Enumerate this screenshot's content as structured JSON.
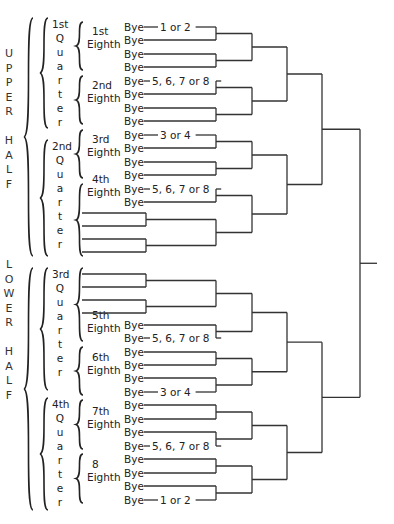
{
  "colors": {
    "ink": "#333333",
    "background": "#ffffff"
  },
  "halves": [
    {
      "label": "UPPER HALF",
      "letters": [
        "U",
        "P",
        "P",
        "E",
        "R",
        "",
        "H",
        "A",
        "L",
        "F"
      ]
    },
    {
      "label": "LOWER HALF",
      "letters": [
        "L",
        "O",
        "W",
        "E",
        "R",
        "",
        "H",
        "A",
        "L",
        "F"
      ]
    }
  ],
  "quarters": [
    {
      "label_lines": [
        "1st",
        "Q",
        "u",
        "a",
        "r",
        "t",
        "e",
        "r"
      ]
    },
    {
      "label_lines": [
        "2nd",
        "Q",
        "u",
        "a",
        "r",
        "t",
        "e",
        "r"
      ]
    },
    {
      "label_lines": [
        "3rd",
        "Q",
        "u",
        "a",
        "r",
        "t",
        "e",
        "r"
      ]
    },
    {
      "label_lines": [
        "4th",
        "Q",
        "u",
        "a",
        "r",
        "t",
        "e",
        "r"
      ]
    }
  ],
  "eighths": [
    {
      "label_lines": [
        "1st",
        "Eighth"
      ]
    },
    {
      "label_lines": [
        "2nd",
        "Eighth"
      ]
    },
    {
      "label_lines": [
        "3rd",
        "Eighth"
      ]
    },
    {
      "label_lines": [
        "4th",
        "Eighth"
      ]
    },
    {
      "label_lines": [
        "5th",
        "Eighth"
      ]
    },
    {
      "label_lines": [
        "6th",
        "Eighth"
      ]
    },
    {
      "label_lines": [
        "7th",
        "Eighth"
      ]
    },
    {
      "label_lines": [
        "8",
        "Eighth"
      ]
    }
  ],
  "bye_label": "Bye",
  "upper_rows": [
    {
      "y": 27,
      "bye": true,
      "seed": "1 or 2"
    },
    {
      "y": 40,
      "bye": true
    },
    {
      "y": 54,
      "bye": true
    },
    {
      "y": 67,
      "bye": true
    },
    {
      "y": 81,
      "bye": true,
      "seed": "5, 6, 7 or 8"
    },
    {
      "y": 94,
      "bye": true
    },
    {
      "y": 108,
      "bye": true
    },
    {
      "y": 121,
      "bye": true
    },
    {
      "y": 135,
      "bye": true,
      "seed": "3 or 4"
    },
    {
      "y": 148,
      "bye": true
    },
    {
      "y": 162,
      "bye": true
    },
    {
      "y": 175,
      "bye": true
    },
    {
      "y": 189,
      "bye": true,
      "seed": "5, 6, 7 or 8"
    },
    {
      "y": 202,
      "bye": true
    }
  ],
  "upper_open_lines": [
    213,
    226,
    239,
    252
  ],
  "lower_open_lines": [
    274,
    287,
    300,
    313
  ],
  "lower_rows": [
    {
      "y": 325,
      "bye": true
    },
    {
      "y": 338,
      "bye": true,
      "seed": "5, 6, 7 or 8"
    },
    {
      "y": 352,
      "bye": true
    },
    {
      "y": 365,
      "bye": true
    },
    {
      "y": 378,
      "bye": true
    },
    {
      "y": 392,
      "bye": true,
      "seed": "3 or 4"
    },
    {
      "y": 405,
      "bye": true
    },
    {
      "y": 419,
      "bye": true
    },
    {
      "y": 432,
      "bye": true
    },
    {
      "y": 446,
      "bye": true,
      "seed": "5, 6, 7 or 8"
    },
    {
      "y": 459,
      "bye": true
    },
    {
      "y": 473,
      "bye": true
    },
    {
      "y": 486,
      "bye": true
    },
    {
      "y": 500,
      "bye": true,
      "seed": "1 or 2"
    }
  ],
  "rounds_x": [
    146,
    216,
    252,
    287,
    322,
    360
  ],
  "final_stub_end_x": 377
}
